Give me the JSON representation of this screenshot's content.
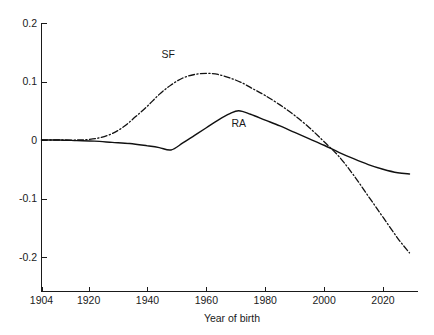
{
  "chart_data": {
    "type": "line",
    "title": "",
    "subtitle": "",
    "xlabel": "Year of birth",
    "ylabel": "",
    "xlim": [
      1904,
      2029
    ],
    "ylim": [
      -0.2,
      0.2
    ],
    "grid": false,
    "legend_position": "inline-annotation",
    "xticks": [
      1904,
      1920,
      1940,
      1960,
      1980,
      2000,
      2020
    ],
    "xticklabels": [
      "1904",
      "1920",
      "1940",
      "1960",
      "1980",
      "2000",
      "2020"
    ],
    "yticks": [
      0.2,
      0.1,
      0,
      -0.1,
      -0.2
    ],
    "yticklabels": [
      "0.2",
      "0.1",
      "0",
      "-0.1",
      "-0.2"
    ],
    "annotations": [
      {
        "text": "SF",
        "x": 1947,
        "y": 0.14
      },
      {
        "text": "RA",
        "x": 1971,
        "y": 0.023
      }
    ],
    "series": [
      {
        "name": "RA",
        "style": "solid",
        "color": "#111111",
        "x": [
          1904,
          1910,
          1916,
          1922,
          1928,
          1934,
          1940,
          1944,
          1948,
          1952,
          1956,
          1960,
          1964,
          1968,
          1971,
          1975,
          1980,
          1985,
          1990,
          1995,
          2000,
          2005,
          2010,
          2015,
          2020,
          2025,
          2029
        ],
        "y": [
          0.0,
          0.0,
          -0.001,
          -0.002,
          -0.004,
          -0.006,
          -0.01,
          -0.013,
          -0.017,
          -0.005,
          0.008,
          0.021,
          0.034,
          0.045,
          0.05,
          0.044,
          0.034,
          0.024,
          0.013,
          0.002,
          -0.009,
          -0.021,
          -0.032,
          -0.042,
          -0.05,
          -0.056,
          -0.058
        ]
      },
      {
        "name": "SF",
        "style": "dash-dot",
        "color": "#111111",
        "x": [
          1904,
          1910,
          1916,
          1920,
          1924,
          1928,
          1932,
          1936,
          1940,
          1944,
          1948,
          1952,
          1956,
          1960,
          1964,
          1968,
          1972,
          1976,
          1980,
          1985,
          1990,
          1995,
          2000,
          2005,
          2010,
          2015,
          2020,
          2025,
          2029
        ],
        "y": [
          0.0,
          0.0,
          0.0,
          0.001,
          0.004,
          0.011,
          0.023,
          0.04,
          0.058,
          0.078,
          0.094,
          0.106,
          0.112,
          0.114,
          0.112,
          0.106,
          0.098,
          0.087,
          0.076,
          0.06,
          0.042,
          0.021,
          -0.003,
          -0.028,
          -0.06,
          -0.096,
          -0.132,
          -0.168,
          -0.193
        ]
      }
    ]
  },
  "axes": {
    "x_axis_name": "Year of birth",
    "y_axis_name": ""
  }
}
